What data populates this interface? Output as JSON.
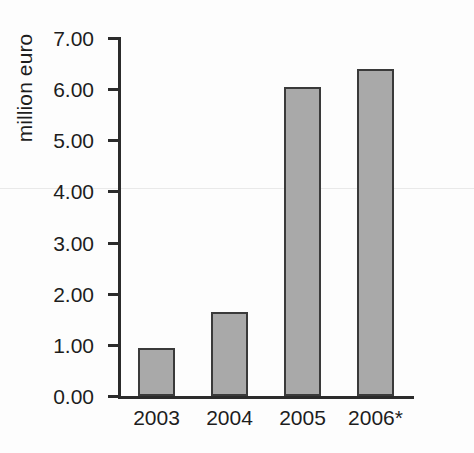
{
  "chart_data": {
    "type": "bar",
    "title": "",
    "subtitle": "",
    "xlabel": "",
    "ylabel": "million euro",
    "categories": [
      "2003",
      "2004",
      "2005",
      "2006*"
    ],
    "values": [
      0.93,
      1.65,
      6.05,
      6.4
    ],
    "series": [
      {
        "name": "million euro",
        "values": [
          0.93,
          1.65,
          6.05,
          6.4
        ]
      }
    ],
    "ylim": [
      0.0,
      7.0
    ],
    "ytick_values": [
      0.0,
      1.0,
      2.0,
      3.0,
      4.0,
      5.0,
      6.0,
      7.0
    ],
    "ytick_labels": [
      "0.00",
      "1.00",
      "2.00",
      "3.00",
      "4.00",
      "5.00",
      "6.00",
      "7.00"
    ],
    "grid": false,
    "legend": false,
    "legend_position": "none",
    "annotations": [
      "* denotes provisional/forecast value"
    ],
    "bar_color": "#a9a9a9",
    "bar_edge_color": "#3a3a3a",
    "axis_color": "#2b2b2b",
    "background_color": "#fdfdfd"
  },
  "figure": {
    "y_axis_title": "million euro"
  }
}
